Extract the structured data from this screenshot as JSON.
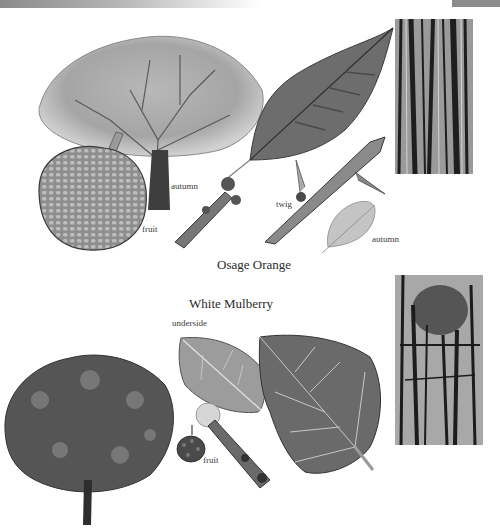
{
  "page": {
    "header_band": "gray gradient strip",
    "sections": [
      {
        "title": "Osage Orange",
        "illustrations": [
          "tree",
          "fruit",
          "leaf",
          "twig",
          "autumn-twig",
          "autumn-leaf",
          "bark"
        ],
        "labels": {
          "fruit": "fruit",
          "autumn_tree": "autumn",
          "twig": "twig",
          "autumn_leaf": "autumn"
        }
      },
      {
        "title": "White Mulberry",
        "illustrations": [
          "tree",
          "underside-leaf",
          "leaf",
          "flower",
          "fruit",
          "twig",
          "bark"
        ],
        "labels": {
          "underside": "underside",
          "fruit": "fruit"
        }
      }
    ]
  },
  "colors": {
    "ink": "#2a2a2a",
    "header_gray": "#8c8c8c",
    "paper": "#ffffff"
  }
}
